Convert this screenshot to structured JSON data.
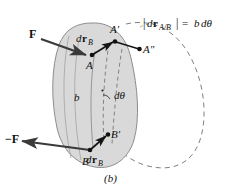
{
  "figure": {
    "caption": "(b)",
    "equation": {
      "abs_open": "|",
      "d": "d",
      "r_bold": "r",
      "subscript": "A/B",
      "abs_close": "|",
      "equals": "=",
      "b": "b",
      "dtheta": "dθ",
      "full_text": "|dᵣA/B| = b dθ"
    },
    "labels": {
      "force_top": "F",
      "force_bottom": "−F",
      "point_a": "A",
      "point_a_prime": "A′",
      "point_a_double_prime": "A″",
      "point_b": "B",
      "point_b_prime": "B′",
      "length_b": "b",
      "angle": "dθ",
      "dr_b_top_d": "d",
      "dr_b_top_r": "r",
      "dr_b_top_sub": "B",
      "dr_b_bottom_d": "d",
      "dr_b_bottom_r": "r",
      "dr_b_bottom_sub": "B"
    },
    "colors": {
      "body_fill": "#d9d9d9",
      "body_stroke": "#8a8a8a",
      "line": "#1a1a1a",
      "dashed": "#777777",
      "arrow": "#3a3a3a",
      "background": "#ffffff",
      "text": "#111111"
    }
  }
}
